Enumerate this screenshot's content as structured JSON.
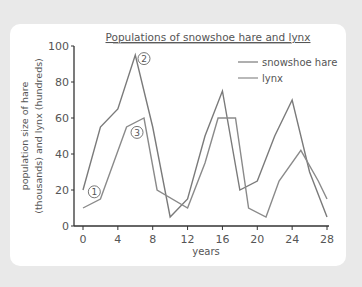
{
  "chart_data": {
    "type": "line",
    "title": "Populations of snowshoe hare and lynx",
    "xlabel": "years",
    "ylabel": "population size of hare (thousands) and lynx (hundreds)",
    "ylabel_lines": [
      "population size of hare",
      "(thousands) and lynx (hundreds)"
    ],
    "xlim": [
      0,
      28
    ],
    "ylim": [
      0,
      100
    ],
    "x_ticks": [
      0,
      4,
      8,
      12,
      16,
      20,
      24,
      28
    ],
    "x_tick_labels": [
      "0",
      "4",
      "8",
      "12",
      "16",
      "20",
      "24",
      "28"
    ],
    "y_ticks": [
      0,
      20,
      40,
      60,
      80,
      100
    ],
    "y_tick_labels": [
      "0",
      "20",
      "40",
      "60",
      "80",
      "100"
    ],
    "grid": false,
    "legend_position": "upper right",
    "series": [
      {
        "name": "snowshoe hare",
        "color": "#7a7a7a",
        "points": [
          [
            0,
            20
          ],
          [
            2,
            55
          ],
          [
            4,
            65
          ],
          [
            6,
            95
          ],
          [
            8,
            55
          ],
          [
            10,
            5
          ],
          [
            12,
            15
          ],
          [
            14,
            50
          ],
          [
            16,
            75
          ],
          [
            18,
            20
          ],
          [
            20,
            25
          ],
          [
            22,
            50
          ],
          [
            24,
            70
          ],
          [
            26,
            30
          ],
          [
            28,
            5
          ]
        ]
      },
      {
        "name": "lynx",
        "color": "#8a8a8a",
        "points": [
          [
            0,
            10
          ],
          [
            2,
            15
          ],
          [
            5,
            55
          ],
          [
            7,
            60
          ],
          [
            8.5,
            20
          ],
          [
            12,
            10
          ],
          [
            14,
            35
          ],
          [
            15.5,
            60
          ],
          [
            17.5,
            60
          ],
          [
            19,
            10
          ],
          [
            21,
            5
          ],
          [
            22.5,
            25
          ],
          [
            25,
            42
          ],
          [
            27,
            25
          ],
          [
            28,
            15
          ]
        ]
      }
    ],
    "annotations": [
      {
        "label": "1",
        "x": 1.3,
        "y": 19
      },
      {
        "label": "2",
        "x": 7,
        "y": 93
      },
      {
        "label": "3",
        "x": 6.2,
        "y": 52
      }
    ]
  }
}
